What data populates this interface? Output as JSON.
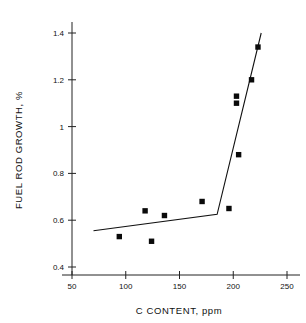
{
  "chart_data": {
    "type": "scatter",
    "title": "",
    "xlabel": "C CONTENT, ppm",
    "ylabel": "FUEL ROD GROWTH, %",
    "xlim": [
      50,
      250
    ],
    "ylim": [
      0.4,
      1.45
    ],
    "grid": false,
    "legend": "none",
    "xticks": [
      50,
      100,
      150,
      200,
      250
    ],
    "xtick_labels": [
      "50",
      "100",
      "150",
      "200",
      "250"
    ],
    "yticks": [
      0.4,
      0.6,
      0.8,
      1.0,
      1.2,
      1.4
    ],
    "ytick_labels": [
      "0.4",
      "0.6",
      "0.8",
      "1",
      "1.2",
      "1.4"
    ],
    "marker": "filled-square",
    "marker_color": "#0a0a0a",
    "points": [
      {
        "x": 94,
        "y": 0.53
      },
      {
        "x": 118,
        "y": 0.64
      },
      {
        "x": 124,
        "y": 0.51
      },
      {
        "x": 136,
        "y": 0.62
      },
      {
        "x": 171,
        "y": 0.68
      },
      {
        "x": 196,
        "y": 0.65
      },
      {
        "x": 203,
        "y": 1.1
      },
      {
        "x": 203,
        "y": 1.13
      },
      {
        "x": 205,
        "y": 0.88
      },
      {
        "x": 217,
        "y": 1.2
      },
      {
        "x": 223,
        "y": 1.34
      }
    ],
    "fit_line": {
      "name": "bilinear-fit",
      "color": "#111111",
      "vertices": [
        {
          "x": 70,
          "y": 0.555
        },
        {
          "x": 185,
          "y": 0.625
        },
        {
          "x": 226,
          "y": 1.4
        }
      ]
    }
  },
  "axes": {
    "x_title": "C CONTENT, ppm",
    "y_title": "FUEL ROD GROWTH, %"
  }
}
